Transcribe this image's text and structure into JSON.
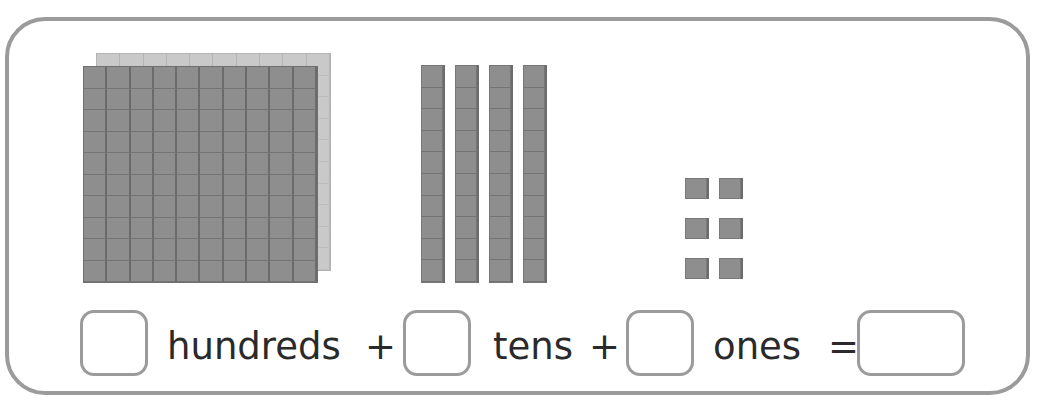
{
  "worksheet": {
    "blocks": {
      "hundreds_flats": 2,
      "tens_rods": 4,
      "ones_units": 6
    },
    "equation": {
      "hundreds_label": "hundreds",
      "plus_1": "+",
      "tens_label": "tens",
      "plus_2": "+",
      "ones_label": "ones",
      "equals": "=",
      "hundreds_answer": "",
      "tens_answer": "",
      "ones_answer": "",
      "total_answer": ""
    },
    "colors": {
      "block_fill": "#8e8e8e",
      "back_flat_fill": "#c9c9c9",
      "frame_border": "#9b9b9b",
      "text": "#2a2a2a"
    }
  }
}
